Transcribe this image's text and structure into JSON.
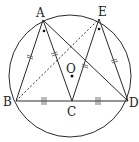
{
  "diagram": {
    "type": "geometry",
    "circle": {
      "center_label": "O",
      "cx": 70,
      "cy": 76,
      "r": 61
    },
    "points": {
      "A": {
        "label": "A",
        "x": 43,
        "y": 20
      },
      "E": {
        "label": "E",
        "x": 99,
        "y": 19
      },
      "B": {
        "label": "B",
        "x": 15,
        "y": 101
      },
      "C": {
        "label": "C",
        "x": 72,
        "y": 101
      },
      "D": {
        "label": "D",
        "x": 128,
        "y": 101
      },
      "O": {
        "label": "O",
        "x": 72,
        "y": 76
      }
    },
    "segments": [
      {
        "from": "A",
        "to": "B",
        "style": "solid",
        "mark": "double-tick"
      },
      {
        "from": "A",
        "to": "C",
        "style": "solid",
        "mark": "double-tick"
      },
      {
        "from": "E",
        "to": "C",
        "style": "solid",
        "mark": "double-tick"
      },
      {
        "from": "E",
        "to": "D",
        "style": "solid",
        "mark": "double-tick"
      },
      {
        "from": "B",
        "to": "C",
        "style": "solid",
        "mark": "triple-tick"
      },
      {
        "from": "C",
        "to": "D",
        "style": "solid",
        "mark": "triple-tick"
      },
      {
        "from": "A",
        "to": "D",
        "style": "solid",
        "mark": ""
      },
      {
        "from": "B",
        "to": "E",
        "style": "dashed",
        "mark": ""
      }
    ],
    "angle_marks": [
      {
        "vertex": "A",
        "mark": "dot"
      },
      {
        "vertex": "E",
        "mark": "dot"
      }
    ],
    "labels": {
      "A": "A",
      "E": "E",
      "B": "B",
      "C": "C",
      "D": "D",
      "O": "O"
    }
  }
}
